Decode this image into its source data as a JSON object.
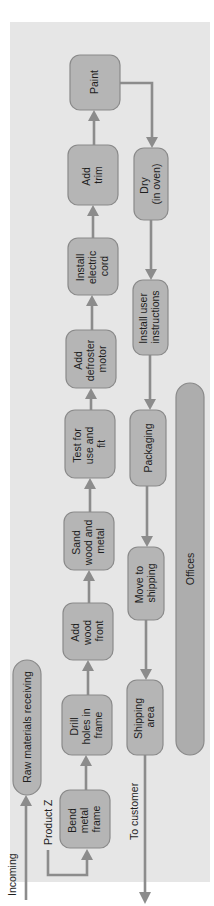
{
  "diagram": {
    "colors": {
      "panel": "#e6e6e6",
      "box_fill": "#b5b5b5",
      "box_stroke": "#8a8a8a",
      "arrow": "#8c8c8c"
    },
    "external_labels": {
      "incoming": "Incoming",
      "to_customer": "To customer",
      "product_z": "Product Z"
    },
    "areas": {
      "raw_materials": "Raw materials receiving",
      "offices": "Offices"
    },
    "steps_top_row": [
      {
        "id": "bend",
        "lines": [
          "Bend",
          "metal",
          "frame"
        ]
      },
      {
        "id": "drill",
        "lines": [
          "Drill",
          "holes in",
          "frame"
        ]
      },
      {
        "id": "wood_front",
        "lines": [
          "Add",
          "wood",
          "front"
        ]
      },
      {
        "id": "sand",
        "lines": [
          "Sand",
          "wood and",
          "metal"
        ]
      },
      {
        "id": "test",
        "lines": [
          "Test for",
          "use and",
          "fit"
        ]
      },
      {
        "id": "defroster",
        "lines": [
          "Add",
          "defroster",
          "motor"
        ]
      },
      {
        "id": "cord",
        "lines": [
          "Install",
          "electric",
          "cord"
        ]
      },
      {
        "id": "trim",
        "lines": [
          "Add",
          "trim"
        ]
      },
      {
        "id": "paint",
        "lines": [
          "Paint"
        ]
      }
    ],
    "steps_bottom_row": [
      {
        "id": "dry",
        "lines": [
          "Dry",
          "(in oven)"
        ]
      },
      {
        "id": "instructions",
        "lines": [
          "Install user",
          "instructions"
        ]
      },
      {
        "id": "packaging",
        "lines": [
          "Packaging"
        ]
      },
      {
        "id": "move",
        "lines": [
          "Move to",
          "shipping"
        ]
      },
      {
        "id": "shipping_area",
        "lines": [
          "Shipping",
          "area"
        ]
      }
    ]
  }
}
